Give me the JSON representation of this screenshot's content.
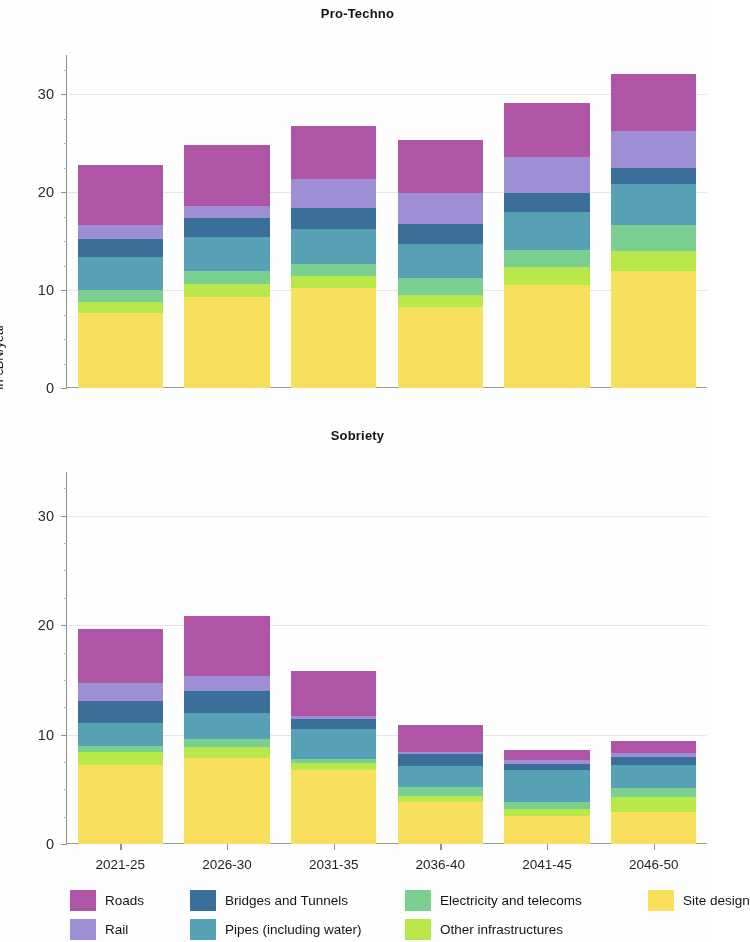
{
  "figure": {
    "y_axis_label": "In €BN/year"
  },
  "panels": [
    {
      "title": "Pro-Techno"
    },
    {
      "title": "Sobriety"
    }
  ],
  "legend": {
    "items": [
      {
        "label": "Roads",
        "color": "#b055a5"
      },
      {
        "label": "Rail",
        "color": "#9d8ed6"
      },
      {
        "label": "Bridges and Tunnels",
        "color": "#3a6f9a"
      },
      {
        "label": "Pipes (including water)",
        "color": "#56a2b4"
      },
      {
        "label": "Electricity and telecoms",
        "color": "#7bcf90"
      },
      {
        "label": "Other infrastructures",
        "color": "#b9e84a"
      },
      {
        "label": "Site design",
        "color": "#f9e martins"
      }
    ]
  },
  "chart_data": [
    {
      "type": "bar",
      "stacked": true,
      "title": "Pro-Techno",
      "xlabel": "",
      "ylabel": "In €BN/year",
      "ylim": [
        0,
        34
      ],
      "yticks": [
        0,
        10,
        20,
        30
      ],
      "grid": true,
      "legend_position": "bottom",
      "categories": [
        "2021-25",
        "2026-30",
        "2031-35",
        "2036-40",
        "2041-45",
        "2046-50"
      ],
      "series": [
        {
          "name": "Site design",
          "color": "#f9e05c",
          "values": [
            7.7,
            9.3,
            10.2,
            8.3,
            10.5,
            11.9
          ]
        },
        {
          "name": "Other infrastructures",
          "color": "#b9e84a",
          "values": [
            1.1,
            1.35,
            1.25,
            1.2,
            1.9,
            2.1
          ]
        },
        {
          "name": "Electricity and telecoms",
          "color": "#7bcf90",
          "values": [
            1.2,
            1.3,
            1.25,
            1.7,
            1.7,
            2.6
          ]
        },
        {
          "name": "Pipes (including water)",
          "color": "#56a2b4",
          "values": [
            3.35,
            3.5,
            3.5,
            3.5,
            3.9,
            4.2
          ]
        },
        {
          "name": "Bridges and Tunnels",
          "color": "#3a6f9a",
          "values": [
            1.9,
            1.95,
            2.15,
            2.0,
            1.9,
            1.7
          ]
        },
        {
          "name": "Rail",
          "color": "#9d8ed6",
          "values": [
            1.4,
            1.2,
            3.0,
            3.2,
            3.7,
            3.7
          ]
        },
        {
          "name": "Roads",
          "color": "#b055a5",
          "values": [
            6.1,
            6.2,
            5.4,
            5.4,
            5.5,
            5.9
          ]
        }
      ],
      "totals": [
        22.8,
        24.8,
        26.8,
        25.3,
        29.1,
        32.1
      ]
    },
    {
      "type": "bar",
      "stacked": true,
      "title": "Sobriety",
      "xlabel": "",
      "ylabel": "In €BN/year",
      "ylim": [
        0,
        34
      ],
      "yticks": [
        0,
        10,
        20,
        30
      ],
      "grid": true,
      "legend_position": "bottom",
      "categories": [
        "2021-25",
        "2026-30",
        "2031-35",
        "2036-40",
        "2041-45",
        "2046-50"
      ],
      "series": [
        {
          "name": "Site design",
          "color": "#f9e05c",
          "values": [
            7.2,
            7.9,
            6.8,
            3.8,
            2.6,
            2.9
          ]
        },
        {
          "name": "Other infrastructures",
          "color": "#b9e84a",
          "values": [
            1.2,
            1.0,
            0.6,
            0.55,
            0.6,
            1.4
          ]
        },
        {
          "name": "Electricity and telecoms",
          "color": "#7bcf90",
          "values": [
            0.6,
            0.7,
            0.4,
            0.9,
            0.6,
            0.8
          ]
        },
        {
          "name": "Pipes (including water)",
          "color": "#56a2b4",
          "values": [
            2.1,
            2.4,
            2.7,
            1.9,
            3.0,
            2.1
          ]
        },
        {
          "name": "Bridges and Tunnels",
          "color": "#3a6f9a",
          "values": [
            2.0,
            2.0,
            0.9,
            1.1,
            0.55,
            0.75
          ]
        },
        {
          "name": "Rail",
          "color": "#9d8ed6",
          "values": [
            1.6,
            1.4,
            0.3,
            0.15,
            0.3,
            0.35
          ]
        },
        {
          "name": "Roads",
          "color": "#b055a5",
          "values": [
            5.0,
            5.4,
            4.1,
            2.5,
            0.9,
            1.1
          ]
        }
      ],
      "totals": [
        19.7,
        20.8,
        15.8,
        10.9,
        8.55,
        9.4
      ]
    }
  ]
}
